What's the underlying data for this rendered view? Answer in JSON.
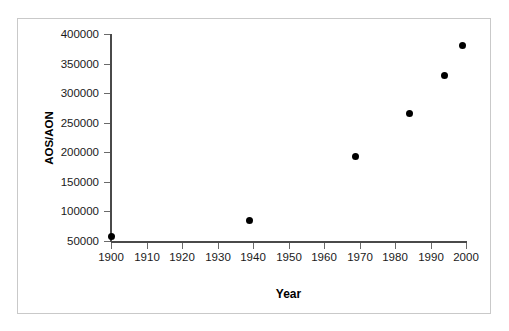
{
  "chart_data": {
    "type": "scatter",
    "title": "",
    "xlabel": "Year",
    "ylabel": "AOS/AON",
    "xlim": [
      1900,
      2000
    ],
    "ylim": [
      50000,
      400000
    ],
    "grid": false,
    "legend": null,
    "marker": {
      "shape": "circle",
      "color": "#000000",
      "size": 7
    },
    "xticks": [
      1900,
      1910,
      1920,
      1930,
      1940,
      1950,
      1960,
      1970,
      1980,
      1990,
      2000
    ],
    "xtick_labels": [
      "1900",
      "1910",
      "1920",
      "1930",
      "1940",
      "1950",
      "1960",
      "1970",
      "1980",
      "1990",
      "2000"
    ],
    "yticks": [
      50000,
      100000,
      150000,
      200000,
      250000,
      300000,
      350000,
      400000
    ],
    "ytick_labels": [
      "50000",
      "100000",
      "150000",
      "200000",
      "250000",
      "300000",
      "350000",
      "400000"
    ],
    "points": [
      {
        "x": 1900,
        "y": 58000
      },
      {
        "x": 1939,
        "y": 85000
      },
      {
        "x": 1969,
        "y": 193000
      },
      {
        "x": 1984,
        "y": 265000
      },
      {
        "x": 1994,
        "y": 329000
      },
      {
        "x": 1999,
        "y": 380000
      }
    ],
    "series": [
      {
        "name": "AOS/AON",
        "x": [
          1900,
          1939,
          1969,
          1984,
          1994,
          1999
        ],
        "values": [
          58000,
          85000,
          193000,
          265000,
          329000,
          380000
        ]
      }
    ]
  },
  "colors": {
    "marker": "#000000",
    "axis": "#4a4a4a",
    "frame": "#c9c9c9",
    "background": "#ffffff",
    "text": "#000000"
  }
}
